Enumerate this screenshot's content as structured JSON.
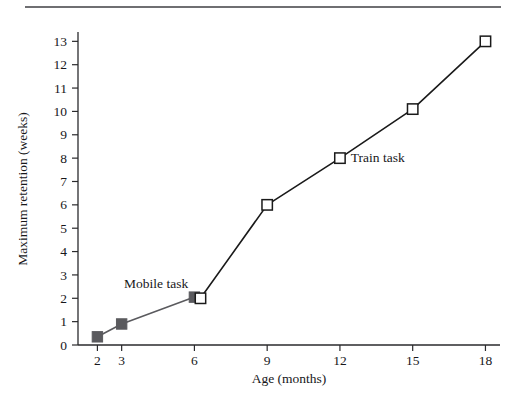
{
  "page": {
    "background_color": "#ffffff",
    "rule_color": "#6f6f72"
  },
  "chart_data": {
    "type": "line",
    "title": "",
    "xlabel": "Age (months)",
    "ylabel": "Maximum retention (weeks)",
    "x_tick_labels": [
      "2",
      "3",
      "6",
      "9",
      "12",
      "15",
      "18"
    ],
    "x_ticks": [
      2,
      3,
      6,
      9,
      12,
      15,
      18
    ],
    "xlim": [
      1.2,
      18.6
    ],
    "y_tick_labels": [
      "0",
      "1",
      "2",
      "3",
      "4",
      "5",
      "6",
      "7",
      "8",
      "9",
      "10",
      "11",
      "12",
      "13"
    ],
    "y_ticks": [
      0,
      1,
      2,
      3,
      4,
      5,
      6,
      7,
      8,
      9,
      10,
      11,
      12,
      13
    ],
    "ylim": [
      0,
      13.4
    ],
    "grid": false,
    "legend_position": "inline-annotations",
    "series": [
      {
        "name": "Mobile task",
        "marker": "filled-square",
        "marker_color": "#5a5a5e",
        "line_color": "#5a5a5e",
        "x": [
          2,
          3,
          6
        ],
        "values": [
          0.35,
          0.9,
          2.05
        ],
        "annotation": "Mobile task",
        "annotation_x": 3.1,
        "annotation_y": 2.45
      },
      {
        "name": "Train task",
        "marker": "open-square",
        "marker_color": "#ffffff",
        "line_color": "#1a1a1a",
        "x": [
          6.25,
          9,
          12,
          15,
          18
        ],
        "values": [
          2.0,
          6.0,
          8.0,
          10.1,
          13.0
        ],
        "annotation": "Train task",
        "annotation_x": 12.45,
        "annotation_y": 7.85
      }
    ]
  }
}
